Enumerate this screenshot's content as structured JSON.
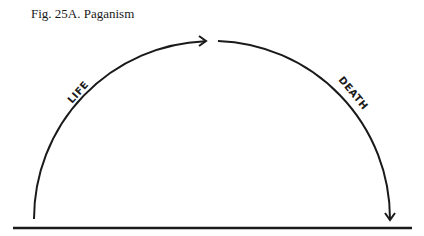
{
  "figure": {
    "caption": "Fig. 25A. Paganism",
    "labels": {
      "ascending": "LIFE",
      "descending": "DEATH"
    },
    "colors": {
      "stroke": "#1a1a1a",
      "background": "#ffffff"
    }
  }
}
